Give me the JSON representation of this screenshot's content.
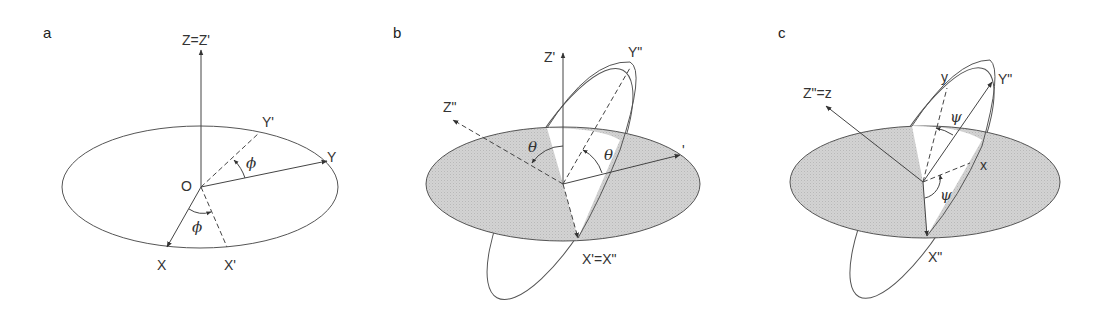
{
  "figure": {
    "colors": {
      "line": "#444444",
      "plane_fill": "#cfcfcf",
      "background": "#ffffff"
    }
  },
  "panels": [
    {
      "letter": "a",
      "labels": {
        "z_axis": "Z=Z'",
        "y_prime": "Y'",
        "y": "Y",
        "origin": "O",
        "x": "X",
        "x_prime": "X'",
        "angle_top": "ϕ",
        "angle_bottom": "ϕ"
      }
    },
    {
      "letter": "b",
      "labels": {
        "z_prime": "Z'",
        "y_double_prime": "Y\"",
        "z_double_prime": "Z\"",
        "y_prime_partial": "'",
        "x_equal": "X'=X\"",
        "angle_left": "θ",
        "angle_right": "θ"
      }
    },
    {
      "letter": "c",
      "labels": {
        "z_equal": "Z\"=z",
        "y_small": "y",
        "y_double_prime": "Y\"",
        "x_small": "x",
        "x_double_prime": "X\"",
        "angle_top": "ψ",
        "angle_bottom": "ψ"
      }
    }
  ]
}
